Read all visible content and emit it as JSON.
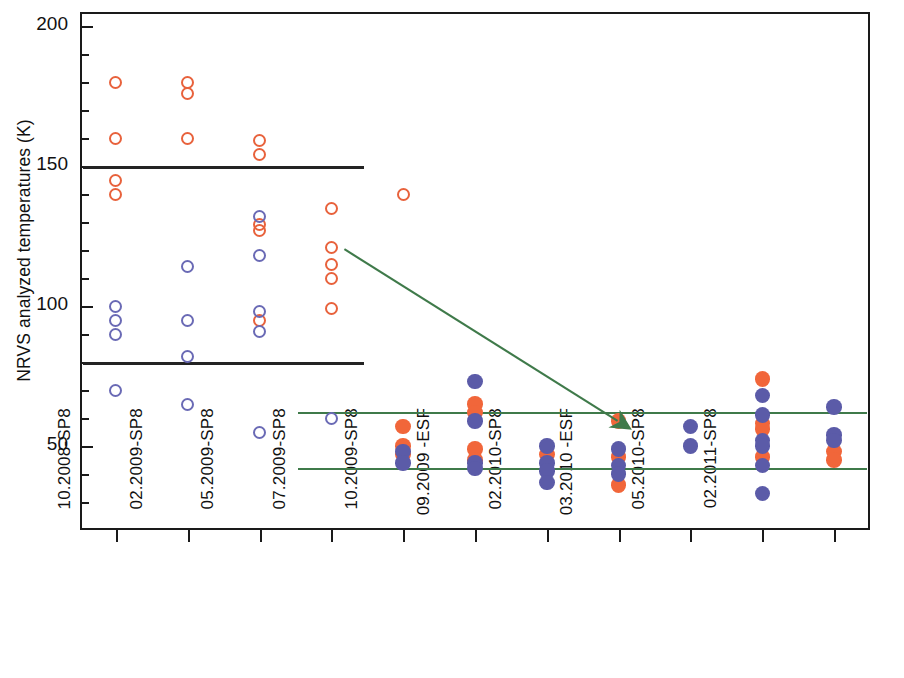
{
  "chart_data": {
    "type": "scatter",
    "title": "",
    "xlabel": "",
    "ylabel": "NRVS analyzed temperatures (K)",
    "ylim": [
      20,
      205
    ],
    "y_ticks_major": [
      50,
      100,
      150,
      200
    ],
    "y_ticks_minor": [
      30,
      40,
      60,
      70,
      80,
      90,
      110,
      120,
      130,
      140,
      160,
      170,
      180,
      190
    ],
    "y_tick_labels": [
      "50",
      "100",
      "150",
      "200"
    ],
    "grid": false,
    "legend": [],
    "categories": [
      "09.2007-SP8",
      "10.2008-SP8",
      "02.2009-SP8",
      "05.2009-SP8",
      "07.2009-SP8",
      "10.2009-SP8",
      "09.2009 -ESF",
      "02.2010-SP8",
      "03.2010 -ESF",
      "05.2010-SP8",
      "02.2011-SP8"
    ],
    "series": [
      {
        "name": "orange-open",
        "color": "#e8623c",
        "marker": "open-circle",
        "points": [
          {
            "category": "09.2007-SP8",
            "value": 180
          },
          {
            "category": "09.2007-SP8",
            "value": 160
          },
          {
            "category": "09.2007-SP8",
            "value": 145
          },
          {
            "category": "09.2007-SP8",
            "value": 140
          },
          {
            "category": "10.2008-SP8",
            "value": 180
          },
          {
            "category": "10.2008-SP8",
            "value": 176
          },
          {
            "category": "10.2008-SP8",
            "value": 160
          },
          {
            "category": "02.2009-SP8",
            "value": 159
          },
          {
            "category": "02.2009-SP8",
            "value": 154
          },
          {
            "category": "02.2009-SP8",
            "value": 129
          },
          {
            "category": "02.2009-SP8",
            "value": 127
          },
          {
            "category": "02.2009-SP8",
            "value": 95
          },
          {
            "category": "05.2009-SP8",
            "value": 135
          },
          {
            "category": "05.2009-SP8",
            "value": 121
          },
          {
            "category": "05.2009-SP8",
            "value": 115
          },
          {
            "category": "05.2009-SP8",
            "value": 110
          },
          {
            "category": "05.2009-SP8",
            "value": 99
          },
          {
            "category": "07.2009-SP8",
            "value": 140
          }
        ]
      },
      {
        "name": "blue-open",
        "color": "#6a6ab5",
        "marker": "open-circle",
        "points": [
          {
            "category": "09.2007-SP8",
            "value": 100
          },
          {
            "category": "09.2007-SP8",
            "value": 95
          },
          {
            "category": "09.2007-SP8",
            "value": 90
          },
          {
            "category": "09.2007-SP8",
            "value": 70
          },
          {
            "category": "10.2008-SP8",
            "value": 114
          },
          {
            "category": "10.2008-SP8",
            "value": 95
          },
          {
            "category": "10.2008-SP8",
            "value": 82
          },
          {
            "category": "10.2008-SP8",
            "value": 65
          },
          {
            "category": "02.2009-SP8",
            "value": 132
          },
          {
            "category": "02.2009-SP8",
            "value": 118
          },
          {
            "category": "02.2009-SP8",
            "value": 98
          },
          {
            "category": "02.2009-SP8",
            "value": 91
          },
          {
            "category": "02.2009-SP8",
            "value": 55
          },
          {
            "category": "05.2009-SP8",
            "value": 60
          }
        ]
      },
      {
        "name": "orange-filled",
        "color": "#f1663a",
        "marker": "filled-circle",
        "points": [
          {
            "category": "07.2009-SP8",
            "value": 57
          },
          {
            "category": "07.2009-SP8",
            "value": 50
          },
          {
            "category": "07.2009-SP8",
            "value": 47
          },
          {
            "category": "10.2009-SP8",
            "value": 65
          },
          {
            "category": "10.2009-SP8",
            "value": 62
          },
          {
            "category": "10.2009-SP8",
            "value": 49
          },
          {
            "category": "10.2009-SP8",
            "value": 45
          },
          {
            "category": "09.2009 -ESF",
            "value": 47
          },
          {
            "category": "02.2010-SP8",
            "value": 59
          },
          {
            "category": "02.2010-SP8",
            "value": 46
          },
          {
            "category": "02.2010-SP8",
            "value": 36
          },
          {
            "category": "05.2010-SP8",
            "value": 74
          },
          {
            "category": "05.2010-SP8",
            "value": 58
          },
          {
            "category": "05.2010-SP8",
            "value": 56
          },
          {
            "category": "05.2010-SP8",
            "value": 46
          },
          {
            "category": "02.2011-SP8",
            "value": 48
          },
          {
            "category": "02.2011-SP8",
            "value": 45
          }
        ]
      },
      {
        "name": "blue-filled",
        "color": "#5b5ba8",
        "marker": "filled-circle",
        "points": [
          {
            "category": "07.2009-SP8",
            "value": 48
          },
          {
            "category": "07.2009-SP8",
            "value": 44
          },
          {
            "category": "10.2009-SP8",
            "value": 73
          },
          {
            "category": "10.2009-SP8",
            "value": 59
          },
          {
            "category": "10.2009-SP8",
            "value": 44
          },
          {
            "category": "10.2009-SP8",
            "value": 42
          },
          {
            "category": "09.2009 -ESF",
            "value": 50
          },
          {
            "category": "09.2009 -ESF",
            "value": 44
          },
          {
            "category": "09.2009 -ESF",
            "value": 41
          },
          {
            "category": "09.2009 -ESF",
            "value": 37
          },
          {
            "category": "02.2010-SP8",
            "value": 49
          },
          {
            "category": "02.2010-SP8",
            "value": 43
          },
          {
            "category": "02.2010-SP8",
            "value": 40
          },
          {
            "category": "03.2010 -ESF",
            "value": 57
          },
          {
            "category": "03.2010 -ESF",
            "value": 50
          },
          {
            "category": "05.2010-SP8",
            "value": 68
          },
          {
            "category": "05.2010-SP8",
            "value": 61
          },
          {
            "category": "05.2010-SP8",
            "value": 52
          },
          {
            "category": "05.2010-SP8",
            "value": 50
          },
          {
            "category": "05.2010-SP8",
            "value": 43
          },
          {
            "category": "05.2010-SP8",
            "value": 33
          },
          {
            "category": "02.2011-SP8",
            "value": 64
          },
          {
            "category": "02.2011-SP8",
            "value": 54
          },
          {
            "category": "02.2011-SP8",
            "value": 52
          }
        ]
      }
    ],
    "reference_lines": [
      {
        "name": "upper-spec-black",
        "value": 150,
        "color": "#232323",
        "x_start_category": "09.2007-SP8",
        "x_end_category": "05.2009-SP8",
        "style": "solid"
      },
      {
        "name": "lower-spec-black",
        "value": 80,
        "color": "#232323",
        "x_start_category": "09.2007-SP8",
        "x_end_category": "05.2009-SP8",
        "style": "solid"
      },
      {
        "name": "upper-spec-green",
        "value": 62,
        "color": "#3f7a4a",
        "x_start_category": "05.2009-SP8",
        "x_end_category": "02.2011-SP8",
        "style": "solid"
      },
      {
        "name": "lower-spec-green",
        "value": 42,
        "color": "#3f7a4a",
        "x_start_category": "05.2009-SP8",
        "x_end_category": "02.2011-SP8",
        "style": "solid"
      }
    ],
    "annotations": [
      {
        "name": "improvement-arrow",
        "type": "arrow",
        "color": "#3f7a4a",
        "from": {
          "category": "05.2009-SP8",
          "value": 122
        },
        "to": {
          "category": "02.2010-SP8",
          "value": 58
        }
      }
    ]
  },
  "axes": {
    "y_title": "NRVS analyzed temperatures (K)"
  },
  "colors": {
    "orange": "#e8623c",
    "orange_filled": "#f1663a",
    "blue": "#6a6ab5",
    "blue_filled": "#5b5ba8",
    "green": "#3f7a4a",
    "black": "#232323"
  }
}
